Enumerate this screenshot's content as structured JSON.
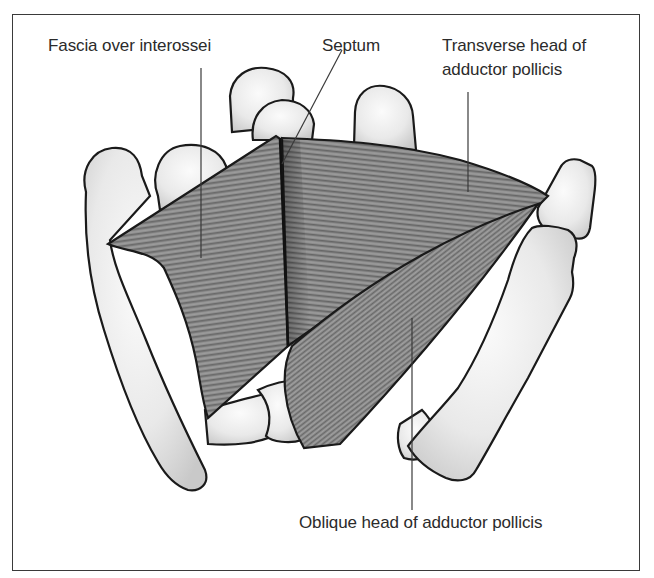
{
  "figure": {
    "labels": {
      "fascia": "Fascia over interossei",
      "septum": "Septum",
      "transverse_line1": "Transverse head of",
      "transverse_line2": "adductor pollicis",
      "oblique": "Oblique head of adductor pollicis"
    },
    "structures": [
      {
        "name": "Fascia over interossei",
        "type": "fascia"
      },
      {
        "name": "Septum",
        "type": "septum"
      },
      {
        "name": "Transverse head of adductor pollicis",
        "type": "muscle"
      },
      {
        "name": "Oblique head of adductor pollicis",
        "type": "muscle"
      }
    ],
    "colors": {
      "bone_fill": "#ececec",
      "bone_outline": "#1a1a1a",
      "muscle_fill": "#8a8a8a",
      "muscle_stripe": "#5e5e5e",
      "frame": "#3a3a3a",
      "text": "#2b2b2b"
    }
  }
}
